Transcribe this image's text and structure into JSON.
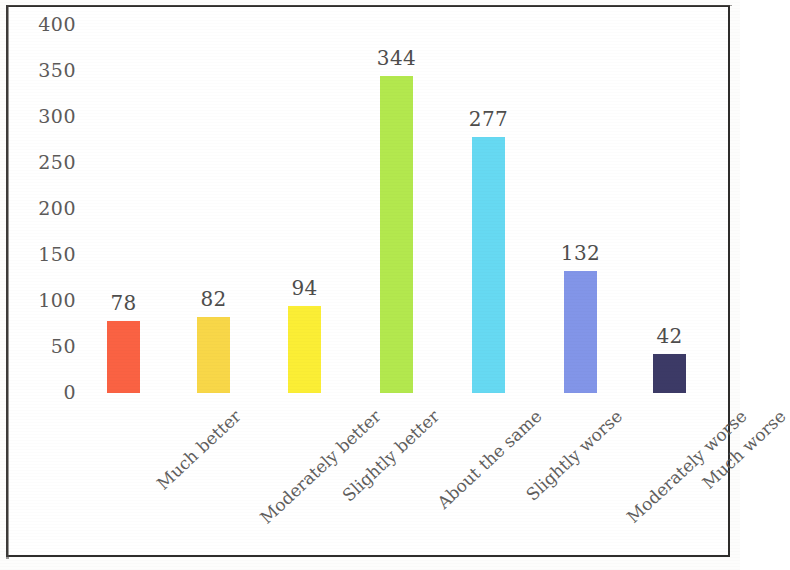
{
  "chart_data": {
    "type": "bar",
    "title": "",
    "subtitle": "",
    "xlabel": "",
    "ylabel": "",
    "ylim": [
      0,
      400
    ],
    "grid": false,
    "legend": false,
    "legend_position": "none",
    "y_ticks": [
      0,
      50,
      100,
      150,
      200,
      250,
      300,
      350,
      400
    ],
    "y_tick_labels": [
      "0",
      "50",
      "100",
      "150",
      "200",
      "250",
      "300",
      "350",
      "400"
    ],
    "categories": [
      "Much better",
      "Moderately better",
      "Slightly better",
      "About the same",
      "Slightly worse",
      "Moderately worse",
      "Much worse"
    ],
    "values": [
      78,
      82,
      94,
      344,
      277,
      132,
      42
    ],
    "value_labels": [
      "78",
      "82",
      "94",
      "344",
      "277",
      "132",
      "42"
    ],
    "bar_colors": [
      "#fa6243",
      "#f8d748",
      "#fbee35",
      "#b3e84e",
      "#66d9f2",
      "#8295e8",
      "#3c3a66"
    ]
  },
  "figure": {
    "frame_color": "#2e2d2b",
    "background_color": "#ffffff",
    "tick_text_color": "#5c5a59",
    "value_text_color": "#4e4d4c",
    "category_text_color": "#5e5c5b"
  }
}
